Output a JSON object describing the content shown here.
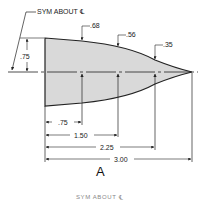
{
  "drawing": {
    "symmetry_note": "SYM ABOUT ℄",
    "half_height_label": ".75",
    "station_heights": [
      {
        "label": ".68",
        "station": 0.75
      },
      {
        "label": ".56",
        "station": 1.5
      },
      {
        "label": ".35",
        "station": 2.25
      }
    ],
    "length_dims": [
      ".75",
      "1.50",
      "2.25",
      "3.00"
    ],
    "figure_label": "A",
    "bottom_caption": "SYM ABOUT ℄",
    "colors": {
      "fill": "#d9d9d9",
      "line": "#222222"
    }
  }
}
